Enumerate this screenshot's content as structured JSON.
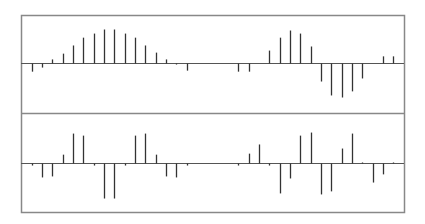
{
  "chart_data": [
    {
      "type": "stem",
      "title": "",
      "xlabel": "",
      "ylabel": "",
      "grid": false,
      "legend": null,
      "panel": "top",
      "ylim": [
        -1.4,
        1.4
      ],
      "x": [
        0,
        1,
        2,
        3,
        4,
        5,
        6,
        7,
        8,
        9,
        10,
        11,
        12,
        13,
        14,
        15,
        16,
        17,
        18,
        19,
        20,
        21,
        22,
        23,
        24,
        25,
        26,
        27,
        28,
        29,
        30,
        31,
        32,
        33,
        34,
        35
      ],
      "values": [
        -0.24,
        -0.12,
        0.12,
        0.29,
        0.53,
        0.76,
        0.88,
        1.0,
        1.0,
        0.88,
        0.76,
        0.53,
        0.32,
        0.12,
        -0.03,
        -0.21,
        0,
        0,
        0,
        0,
        -0.24,
        -0.24,
        0,
        0.38,
        0.76,
        0.97,
        0.88,
        0.5,
        -0.53,
        -0.94,
        -1.0,
        -0.82,
        -0.44,
        0,
        0.21,
        0.21
      ]
    },
    {
      "type": "stem",
      "title": "",
      "xlabel": "",
      "ylabel": "",
      "grid": false,
      "legend": null,
      "panel": "bottom",
      "ylim": [
        -1.4,
        1.4
      ],
      "x": [
        0,
        1,
        2,
        3,
        4,
        5,
        6,
        7,
        8,
        9,
        10,
        11,
        12,
        13,
        14,
        15,
        16,
        17,
        18,
        19,
        20,
        21,
        22,
        23,
        24,
        25,
        26,
        27,
        28,
        29,
        30,
        31,
        32,
        33,
        34,
        35
      ],
      "values": [
        -0.06,
        -0.41,
        -0.38,
        0.26,
        0.88,
        0.82,
        -0.06,
        -1.03,
        -1.03,
        -0.06,
        0.82,
        0.88,
        0.26,
        -0.38,
        -0.41,
        -0.06,
        0,
        0,
        0,
        0,
        -0.06,
        0.29,
        0.56,
        -0.06,
        -0.88,
        -0.44,
        0.82,
        0.91,
        -0.91,
        -0.82,
        0.44,
        0.88,
        0.03,
        -0.56,
        -0.32,
        0.03
      ]
    }
  ],
  "style": {
    "frame_color": "#888888",
    "stem_color": "#333333",
    "baseline_color": "#555555",
    "background": "#ffffff"
  }
}
